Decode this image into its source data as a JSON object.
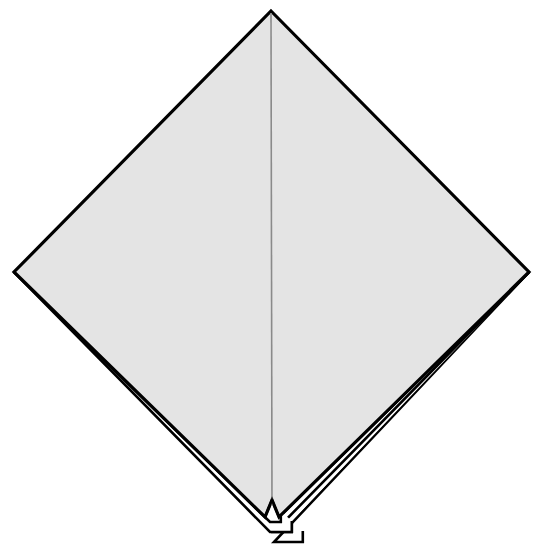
{
  "figure": {
    "type": "line-diagram",
    "width": 539,
    "height": 556,
    "background_color": "#ffffff",
    "paper_fill_color": "#e4e4e4",
    "outline_color": "#000000",
    "fold_line_color": "#8a8a8a",
    "caption": ""
  },
  "geometry": {
    "vertices": {
      "top": {
        "x": 271,
        "y": 11
      },
      "left": {
        "x": 14,
        "y": 272
      },
      "right": {
        "x": 529,
        "y": 272
      },
      "bottom": {
        "x": 272,
        "y": 514
      }
    },
    "center_fold": {
      "label": "vertical-center-fold",
      "from": {
        "x": 271,
        "y": 11
      },
      "to": {
        "x": 272,
        "y": 514
      },
      "stroke_width": 1.6
    },
    "main_outline_stroke_width": 3.2,
    "layer_stroke_width": 2.6,
    "layers_left": [
      {
        "label": "layer-left-1",
        "offset_x": 4,
        "offset_y": 8
      },
      {
        "label": "layer-left-2",
        "offset_x": 9,
        "offset_y": 18
      }
    ],
    "layers_right": [
      {
        "label": "layer-right-1",
        "offset_x": -4,
        "offset_y": 8
      },
      {
        "label": "layer-right-2",
        "offset_x": -9,
        "offset_y": 18
      },
      {
        "label": "layer-right-3",
        "offset_x": -14,
        "offset_y": 28
      }
    ],
    "notch": {
      "label": "center-notch",
      "apex": {
        "x": 272,
        "y": 514
      },
      "depth": 14,
      "half_width": 7
    }
  },
  "annotations": {
    "step_number": "",
    "instruction_text": "",
    "arrows": []
  }
}
